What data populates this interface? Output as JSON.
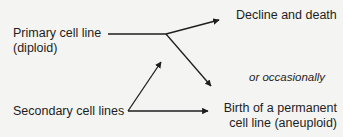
{
  "diagram": {
    "nodes": {
      "primary": {
        "line1": "Primary cell line",
        "line2": "(diploid)"
      },
      "secondary": {
        "label": "Secondary cell lines"
      },
      "decline": {
        "label": "Decline and death"
      },
      "birth": {
        "line1": "Birth of a permanent",
        "line2": "cell line (aneuploid)"
      }
    },
    "annotation": "or occasionally",
    "edges": [
      {
        "from": "primary",
        "to": "decline"
      },
      {
        "from": "primary",
        "to": "birth"
      },
      {
        "from": "secondary",
        "to": "primary"
      },
      {
        "from": "secondary",
        "to": "birth"
      }
    ],
    "colors": {
      "line": "#1e1e1e",
      "background": "#f4f4f2"
    }
  }
}
